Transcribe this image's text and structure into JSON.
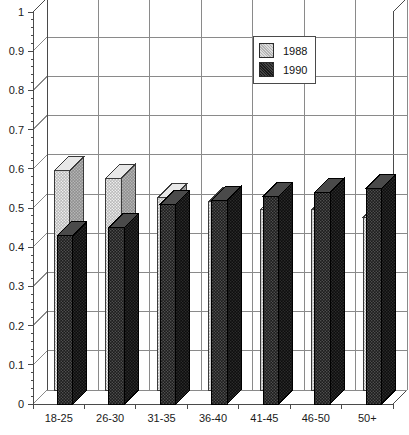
{
  "title_sliver": "percentage of respondents by age group",
  "legend": {
    "position": "inside-top-right",
    "entries": [
      {
        "label": "1988",
        "color": "#b3b3b3",
        "icon": "square-swatch-icon"
      },
      {
        "label": "1990",
        "color": "#1a1a1a",
        "icon": "square-swatch-icon"
      }
    ]
  },
  "axes": {
    "y_tick_labels": [
      "1",
      "0.9",
      "0.8",
      "0.7",
      "0.6",
      "0.5",
      "0.4",
      "0.3",
      "0.2",
      "0.1",
      "0"
    ],
    "x_tick_labels": [
      "18-25",
      "26-30",
      "31-35",
      "36-40",
      "41-45",
      "46-50",
      "50+"
    ]
  },
  "chart_data": {
    "type": "bar",
    "title": "",
    "xlabel": "",
    "ylabel": "",
    "ylim": [
      0,
      1
    ],
    "ytick_step": 0.1,
    "grid": true,
    "legend_position": "inside-top-right",
    "style": "3d-clustered-column",
    "categories": [
      "18-25",
      "26-30",
      "31-35",
      "36-40",
      "41-45",
      "46-50",
      "50+"
    ],
    "series": [
      {
        "name": "1988",
        "color": "#b3b3b3",
        "values": [
          0.56,
          0.54,
          0.49,
          0.48,
          0.46,
          0.46,
          0.44
        ]
      },
      {
        "name": "1990",
        "color": "#1a1a1a",
        "values": [
          0.43,
          0.45,
          0.51,
          0.52,
          0.53,
          0.54,
          0.55
        ]
      }
    ]
  },
  "colors": {
    "grid": "#8a8a8a",
    "axis": "#4a4a4a",
    "plot_background": "#ffffff",
    "series_1988_front": "#b8b8b8",
    "series_1988_side": "#8f8f8f",
    "series_1988_top": "#e8e8e8",
    "series_1990_front": "#1c1c1c",
    "series_1990_side": "#0d0d0d",
    "series_1990_top": "#4a4a4a"
  }
}
